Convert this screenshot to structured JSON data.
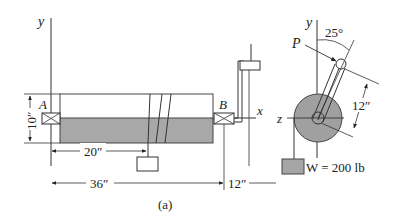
{
  "figure": {
    "caption": "(a)",
    "colors": {
      "shaft_fill": "#a8a8a8",
      "pulley_fill": "#a0a0a0",
      "weight_fill": "#a5a5a5",
      "line": "#333333"
    },
    "axes": {
      "left_y": "y",
      "x": "x",
      "z": "z",
      "right_y": "y"
    },
    "bearings": {
      "a": "A",
      "b": "B"
    },
    "dimensions": {
      "height": "10″",
      "load_position": "20″",
      "span": "36″",
      "overhang": "12″",
      "crank_length": "12″",
      "angle": "25°"
    },
    "forces": {
      "p": "P",
      "weight": "W = 200 lb"
    }
  }
}
